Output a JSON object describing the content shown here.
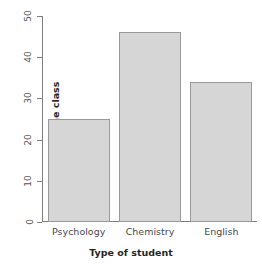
{
  "chart_data": {
    "type": "bar",
    "title": "",
    "categories": [
      "Psychology",
      "Chemistry",
      "English"
    ],
    "values": [
      25,
      46,
      34
    ],
    "series": [
      {
        "name": "Number in the class",
        "values": [
          25,
          46,
          34
        ]
      }
    ],
    "xlabel": "Type of student",
    "ylabel": "Number in the class",
    "ylim": [
      0,
      50
    ],
    "yticks": [
      0,
      10,
      20,
      30,
      40,
      50
    ],
    "ytick_labels": [
      "0",
      "10",
      "20",
      "30",
      "40",
      "50"
    ],
    "grid": false,
    "legend": false,
    "legend_position": "none",
    "bar_fill_color": "#d6d6d6",
    "bar_border_color": "#9a9a9a",
    "axis_color": "#808080",
    "background_color": "#ffffff",
    "tick_label_rotation": 90
  }
}
